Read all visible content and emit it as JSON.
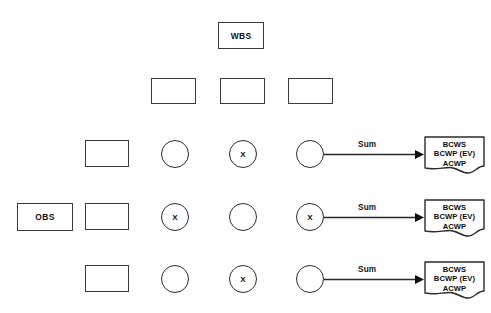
{
  "diagram": {
    "title_fragment": "",
    "canvas": {
      "width": 491,
      "height": 313,
      "background": "#fefefe"
    },
    "colors": {
      "stroke": "#3a3a3a",
      "circle_stroke": "#2b2b2b",
      "text": "#111111",
      "fill": "#ffffff"
    },
    "wbs_node": {
      "label": "WBS",
      "x": 218,
      "y": 22,
      "w": 46,
      "h": 27
    },
    "obs_node": {
      "label": "OBS",
      "x": 17,
      "y": 203,
      "w": 56,
      "h": 28
    },
    "wbs_children": [
      {
        "label": "",
        "x": 151,
        "y": 78,
        "w": 45,
        "h": 26
      },
      {
        "label": "",
        "x": 220,
        "y": 78,
        "w": 45,
        "h": 26
      },
      {
        "label": "",
        "x": 288,
        "y": 78,
        "w": 45,
        "h": 26
      }
    ],
    "obs_children": [
      {
        "label": "",
        "x": 85,
        "y": 140,
        "w": 44,
        "h": 27
      },
      {
        "label": "",
        "x": 85,
        "y": 203,
        "w": 44,
        "h": 27
      },
      {
        "label": "",
        "x": 85,
        "y": 265,
        "w": 44,
        "h": 27
      }
    ],
    "matrix": {
      "row_centers_y": [
        154,
        217,
        279
      ],
      "column_centers_x": [
        175,
        243,
        310
      ],
      "radius": 14,
      "rows": [
        {
          "cells": [
            {
              "marked": false,
              "label": ""
            },
            {
              "marked": true,
              "label": "X"
            },
            {
              "marked": false,
              "label": ""
            }
          ]
        },
        {
          "cells": [
            {
              "marked": true,
              "label": "X"
            },
            {
              "marked": false,
              "label": ""
            },
            {
              "marked": true,
              "label": "X"
            }
          ]
        },
        {
          "cells": [
            {
              "marked": false,
              "label": ""
            },
            {
              "marked": true,
              "label": "X"
            },
            {
              "marked": false,
              "label": ""
            }
          ]
        }
      ]
    },
    "sum_connectors": [
      {
        "label": "Sum",
        "from_x": 324,
        "to_x": 424,
        "y": 154,
        "label_x": 358,
        "label_y": 143
      },
      {
        "label": "Sum",
        "from_x": 324,
        "to_x": 424,
        "y": 217,
        "label_x": 358,
        "label_y": 206
      },
      {
        "label": "Sum",
        "from_x": 324,
        "to_x": 424,
        "y": 279,
        "label_x": 358,
        "label_y": 268
      }
    ],
    "documents": [
      {
        "lines": [
          "BCWS",
          "BCWP (EV)",
          "ACWP"
        ],
        "x": 424,
        "y": 136,
        "w": 61,
        "h": 36
      },
      {
        "lines": [
          "BCWS",
          "BCWP (EV)",
          "ACWP"
        ],
        "x": 424,
        "y": 199,
        "w": 61,
        "h": 36
      },
      {
        "lines": [
          "BCWS",
          "BCWP (EV)",
          "ACWP"
        ],
        "x": 424,
        "y": 261,
        "w": 61,
        "h": 36
      }
    ]
  }
}
